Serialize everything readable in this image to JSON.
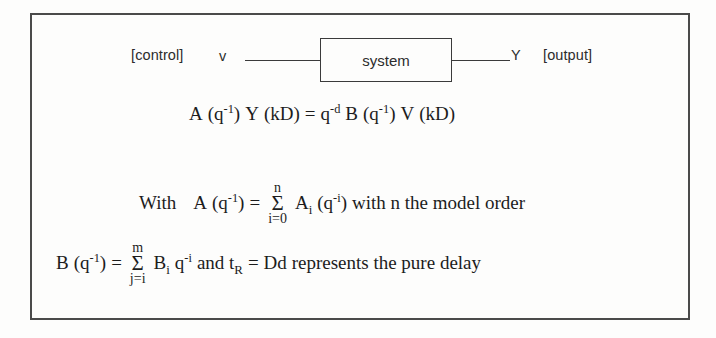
{
  "figure": {
    "type": "control-system-block-diagram",
    "diagram": {
      "input_annotation": "[control]",
      "input_signal": "v",
      "block_label": "system",
      "output_signal": "Y",
      "output_annotation": "[output]"
    },
    "equations": {
      "main": {
        "lhs_A": "A",
        "lhs_A_arg_open": "(q",
        "lhs_A_exp": "-1",
        "lhs_A_arg_close": ")",
        "lhs_Y": "Y",
        "lhs_Y_arg": "(kD)",
        "equals": "=",
        "rhs_q": "q",
        "rhs_q_exp": "-d",
        "rhs_B": "B",
        "rhs_B_arg_open": "(q",
        "rhs_B_exp": "-1",
        "rhs_B_arg_close": ")",
        "rhs_V": "V",
        "rhs_V_arg": "(kD)"
      },
      "with_line": {
        "prefix": "With",
        "A": "A",
        "A_arg_open": "(q",
        "A_exp": "-1",
        "A_arg_close": ")",
        "equals": "=",
        "sum_upper": "n",
        "sum_symbol": "Σ",
        "sum_lower": "i=0",
        "term_A": "A",
        "term_A_sub": "i",
        "term_arg_open": "(q",
        "term_exp": "-i",
        "term_arg_close": ")",
        "suffix": "with n the model order"
      },
      "b_line": {
        "B": "B",
        "B_arg_open": "(q",
        "B_exp": "-1",
        "B_arg_close": ")",
        "equals": "=",
        "sum_upper": "m",
        "sum_symbol": "Σ",
        "sum_lower": "j=i",
        "term_B": "B",
        "term_B_sub": "i",
        "term_q": "q",
        "term_q_exp": "-i",
        "mid": "and t",
        "mid_sub": "R",
        "equals2": "= Dd",
        "suffix": "represents the pure delay"
      }
    },
    "colors": {
      "background": "#fdfdfc",
      "ink": "#1c1c1c",
      "frame": "#4a4a4a",
      "wire": "#3b3b3b"
    }
  }
}
